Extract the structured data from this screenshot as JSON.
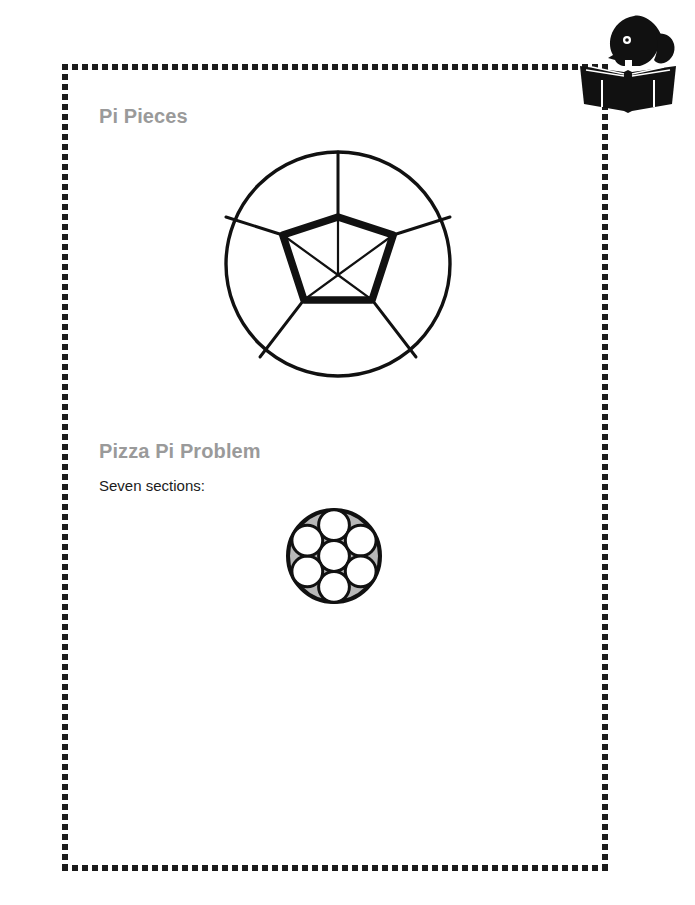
{
  "page": {
    "background_color": "#ffffff",
    "width": 695,
    "height": 905
  },
  "frame": {
    "style": "dotted-square-border",
    "color": "#1b1b1b",
    "dot_size": 6,
    "dot_spacing": 10,
    "left": 62,
    "top": 64,
    "right": 608,
    "bottom": 868
  },
  "logo": {
    "name": "reader-silhouette-logo",
    "description": "Black silhouette of a person's head reading an open book",
    "color": "#111111"
  },
  "sections": [
    {
      "heading": "Pi Pieces",
      "heading_color": "#9a9a9a",
      "figure": {
        "name": "circle-pentagon-diagram",
        "type": "geometric-diagram",
        "description": "Circle with inscribed pentagon, radii to pentagon vertices, and spokes from pentagon vertices to the circle",
        "stroke_color": "#111111",
        "circle_stroke_width": 3,
        "pentagon_stroke_width": 7,
        "radius_stroke_width": 2,
        "circle": {
          "cx": 128,
          "cy": 124,
          "r": 114
        },
        "pentagon_center": {
          "cx": 128,
          "cy": 135
        },
        "pentagon_r": 58,
        "vertices": 5
      }
    },
    {
      "heading": "Pizza Pi Problem",
      "heading_color": "#9a9a9a",
      "subtext": "Seven sections:",
      "subtext_color": "#1b1b1b",
      "figure": {
        "name": "seven-circle-packing-diagram",
        "type": "geometric-diagram",
        "description": "Large circle containing seven equal circles: one centered, six surrounding it; interstitial gaps shaded gray",
        "stroke_color": "#111111",
        "gap_fill_color": "#b8b8b8",
        "inner_fill_color": "#ffffff",
        "outer_circle": {
          "cx": 56,
          "cy": 56,
          "r": 48
        },
        "inner_circle_r": 15.7,
        "inner_circle_count": 7,
        "outer_stroke_width": 4,
        "inner_stroke_width": 3
      }
    }
  ]
}
